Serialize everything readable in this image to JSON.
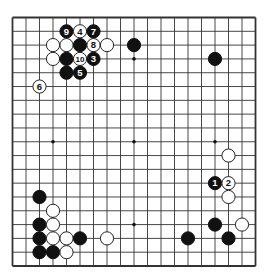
{
  "board": {
    "size": 19,
    "line_color": "#333333",
    "background": "#ffffff",
    "star_points": [
      [
        3,
        3
      ],
      [
        9,
        3
      ],
      [
        15,
        3
      ],
      [
        3,
        9
      ],
      [
        9,
        9
      ],
      [
        15,
        9
      ],
      [
        3,
        15
      ],
      [
        9,
        15
      ],
      [
        15,
        15
      ]
    ],
    "stones": [
      {
        "color": "black",
        "col": 4,
        "row": 1,
        "label": "9"
      },
      {
        "color": "white",
        "col": 5,
        "row": 1,
        "label": "4"
      },
      {
        "color": "black",
        "col": 6,
        "row": 1,
        "label": "7"
      },
      {
        "color": "white",
        "col": 3,
        "row": 2,
        "label": ""
      },
      {
        "color": "white",
        "col": 4,
        "row": 2,
        "label": ""
      },
      {
        "color": "black",
        "col": 5,
        "row": 2,
        "label": ""
      },
      {
        "color": "white",
        "col": 6,
        "row": 2,
        "label": "8"
      },
      {
        "color": "white",
        "col": 7,
        "row": 2,
        "label": ""
      },
      {
        "color": "black",
        "col": 9,
        "row": 2,
        "label": ""
      },
      {
        "color": "white",
        "col": 3,
        "row": 3,
        "label": ""
      },
      {
        "color": "black",
        "col": 4,
        "row": 3,
        "label": ""
      },
      {
        "color": "white",
        "col": 5,
        "row": 3,
        "label": "10"
      },
      {
        "color": "black",
        "col": 6,
        "row": 3,
        "label": "3"
      },
      {
        "color": "black",
        "col": 15,
        "row": 3,
        "label": ""
      },
      {
        "color": "black",
        "col": 4,
        "row": 4,
        "label": ""
      },
      {
        "color": "black",
        "col": 5,
        "row": 4,
        "label": "5"
      },
      {
        "color": "white",
        "col": 2,
        "row": 5,
        "label": "6"
      },
      {
        "color": "white",
        "col": 16,
        "row": 10,
        "label": ""
      },
      {
        "color": "black",
        "col": 15,
        "row": 12,
        "label": "1"
      },
      {
        "color": "white",
        "col": 16,
        "row": 12,
        "label": "2"
      },
      {
        "color": "black",
        "col": 2,
        "row": 13,
        "label": ""
      },
      {
        "color": "white",
        "col": 16,
        "row": 13,
        "label": ""
      },
      {
        "color": "white",
        "col": 3,
        "row": 14,
        "label": ""
      },
      {
        "color": "black",
        "col": 2,
        "row": 15,
        "label": ""
      },
      {
        "color": "white",
        "col": 3,
        "row": 15,
        "label": ""
      },
      {
        "color": "black",
        "col": 15,
        "row": 15,
        "label": ""
      },
      {
        "color": "white",
        "col": 17,
        "row": 15,
        "label": ""
      },
      {
        "color": "black",
        "col": 2,
        "row": 16,
        "label": ""
      },
      {
        "color": "white",
        "col": 3,
        "row": 16,
        "label": ""
      },
      {
        "color": "white",
        "col": 4,
        "row": 16,
        "label": ""
      },
      {
        "color": "black",
        "col": 5,
        "row": 16,
        "label": ""
      },
      {
        "color": "white",
        "col": 7,
        "row": 16,
        "label": ""
      },
      {
        "color": "black",
        "col": 13,
        "row": 16,
        "label": ""
      },
      {
        "color": "black",
        "col": 16,
        "row": 16,
        "label": ""
      },
      {
        "color": "black",
        "col": 2,
        "row": 17,
        "label": ""
      },
      {
        "color": "black",
        "col": 3,
        "row": 17,
        "label": ""
      },
      {
        "color": "white",
        "col": 4,
        "row": 17,
        "label": ""
      }
    ]
  }
}
